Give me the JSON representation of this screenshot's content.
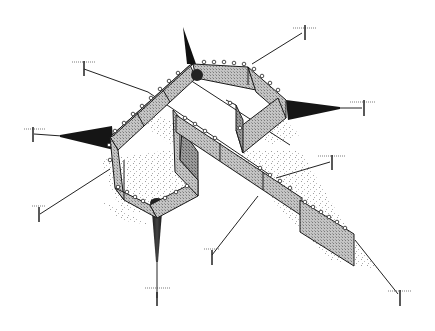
{
  "figure": {
    "title": "",
    "colors": {
      "panel_fill": "#b8b8b8",
      "panel_dark": "#8c8c8c",
      "outline": "#1a1a1a",
      "shadow": "#9a9a9a",
      "background": "#ffffff"
    },
    "anchors": [
      {
        "id": "anchor-nw",
        "x": 80,
        "y": 67
      },
      {
        "id": "anchor-n",
        "x": 303,
        "y": 30
      },
      {
        "id": "anchor-e",
        "x": 364,
        "y": 106
      },
      {
        "id": "anchor-w",
        "x": 31,
        "y": 132
      },
      {
        "id": "anchor-ene",
        "x": 331,
        "y": 160
      },
      {
        "id": "anchor-sw",
        "x": 38,
        "y": 213
      },
      {
        "id": "anchor-s",
        "x": 211,
        "y": 258
      },
      {
        "id": "anchor-ssw",
        "x": 157,
        "y": 300
      },
      {
        "id": "anchor-se",
        "x": 400,
        "y": 297
      }
    ],
    "cones": [
      {
        "id": "cone-top",
        "tip": [
          183,
          27
        ],
        "base": [
          193,
          68
        ]
      },
      {
        "id": "cone-right",
        "tip": [
          340,
          108
        ],
        "base": [
          284,
          108
        ]
      },
      {
        "id": "cone-left",
        "tip": [
          60,
          136
        ],
        "base": [
          115,
          140
        ]
      },
      {
        "id": "cone-bottom",
        "tip": [
          157,
          262
        ],
        "base": [
          157,
          203
        ]
      }
    ],
    "float_marker": {
      "x": 197,
      "y": 75,
      "r": 6
    }
  }
}
